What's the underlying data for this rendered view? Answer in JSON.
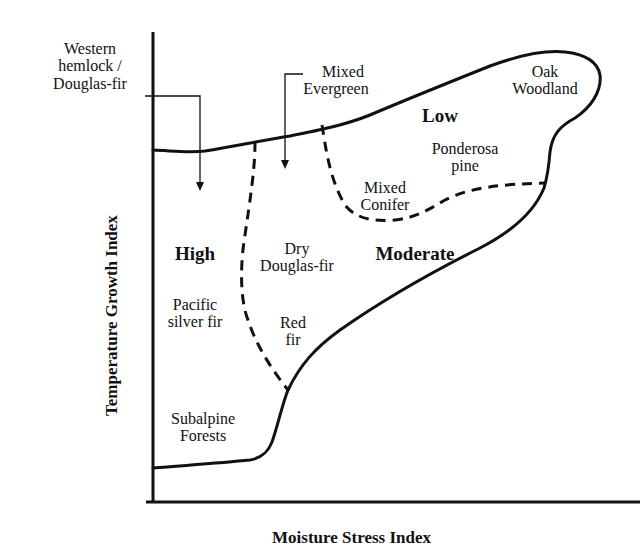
{
  "axes": {
    "x_label": "Moisture Stress Index",
    "y_label": "Temperature Growth Index"
  },
  "zones": {
    "high": "High",
    "moderate": "Moderate",
    "low": "Low"
  },
  "forest_types": {
    "western_hemlock_line1": "Western",
    "western_hemlock_line2": "hemlock /",
    "western_hemlock_line3": "Douglas-fir",
    "mixed_evergreen_line1": "Mixed",
    "mixed_evergreen_line2": "Evergreen",
    "oak_woodland_line1": "Oak",
    "oak_woodland_line2": "Woodland",
    "ponderosa_line1": "Ponderosa",
    "ponderosa_line2": "pine",
    "mixed_conifer_line1": "Mixed",
    "mixed_conifer_line2": "Conifer",
    "dry_df_line1": "Dry",
    "dry_df_line2": "Douglas-fir",
    "pacific_silver_line1": "Pacific",
    "pacific_silver_line2": "silver fir",
    "red_fir_line1": "Red",
    "red_fir_line2": "fir",
    "subalpine_line1": "Subalpine",
    "subalpine_line2": "Forests"
  },
  "colors": {
    "line": "#111111",
    "background": "#ffffff"
  }
}
